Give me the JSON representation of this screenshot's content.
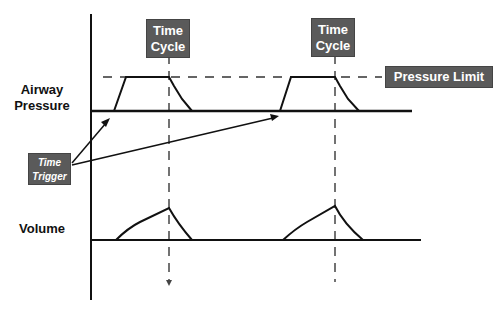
{
  "labels": {
    "airway_pressure_line1": "Airway",
    "airway_pressure_line2": "Pressure",
    "volume": "Volume"
  },
  "callouts": {
    "time_cycle_1_line1": "Time",
    "time_cycle_1_line2": "Cycle",
    "time_cycle_2_line1": "Time",
    "time_cycle_2_line2": "Cycle",
    "pressure_limit": "Pressure Limit",
    "time_trigger_line1": "Time",
    "time_trigger_line2": "Trigger"
  },
  "colors": {
    "line": "#111111",
    "dash": "#333333",
    "callout_bg": "#5a5a5a",
    "callout_text": "#ffffff"
  }
}
